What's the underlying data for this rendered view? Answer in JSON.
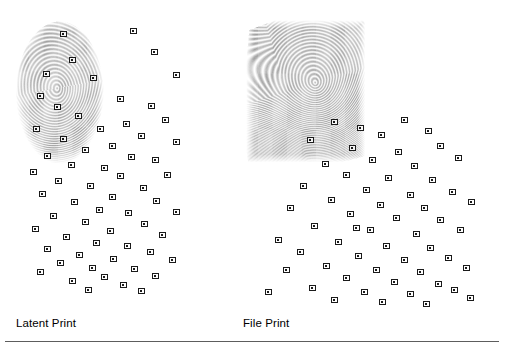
{
  "figure": {
    "title_visible": false,
    "background_color": "#ffffff",
    "ridge_color": "#9a9a9a",
    "marker_color": "#1a1a1a",
    "rule_color": "#5d5d5d"
  },
  "panels": [
    {
      "id": "latent",
      "caption": "Latent Print",
      "caption_x": 16,
      "caption_y": 316,
      "shape": "oval",
      "frame": {
        "x": 14,
        "y": 16,
        "width": 182,
        "height": 296
      },
      "core": {
        "x": 100,
        "y": 160
      },
      "ridge_spacing": 6.2,
      "ridge_color": "#9a9a9a",
      "minutiae_count": 63,
      "minutiae": [
        [
          63,
          34
        ],
        [
          133,
          31
        ],
        [
          154,
          52
        ],
        [
          72,
          60
        ],
        [
          46,
          74
        ],
        [
          176,
          75
        ],
        [
          93,
          78
        ],
        [
          40,
          96
        ],
        [
          120,
          99
        ],
        [
          57,
          107
        ],
        [
          151,
          106
        ],
        [
          78,
          116
        ],
        [
          126,
          124
        ],
        [
          165,
          120
        ],
        [
          36,
          129
        ],
        [
          100,
          129
        ],
        [
          141,
          136
        ],
        [
          63,
          139
        ],
        [
          112,
          146
        ],
        [
          176,
          142
        ],
        [
          85,
          150
        ],
        [
          47,
          156
        ],
        [
          131,
          157
        ],
        [
          155,
          160
        ],
        [
          71,
          165
        ],
        [
          104,
          168
        ],
        [
          33,
          172
        ],
        [
          120,
          176
        ],
        [
          167,
          175
        ],
        [
          58,
          181
        ],
        [
          90,
          186
        ],
        [
          143,
          188
        ],
        [
          42,
          194
        ],
        [
          112,
          197
        ],
        [
          74,
          202
        ],
        [
          156,
          201
        ],
        [
          99,
          210
        ],
        [
          128,
          213
        ],
        [
          53,
          216
        ],
        [
          176,
          212
        ],
        [
          85,
          222
        ],
        [
          144,
          224
        ],
        [
          35,
          229
        ],
        [
          110,
          231
        ],
        [
          66,
          237
        ],
        [
          162,
          235
        ],
        [
          96,
          243
        ],
        [
          127,
          246
        ],
        [
          47,
          249
        ],
        [
          79,
          255
        ],
        [
          150,
          252
        ],
        [
          113,
          259
        ],
        [
          60,
          263
        ],
        [
          172,
          260
        ],
        [
          92,
          268
        ],
        [
          134,
          269
        ],
        [
          40,
          272
        ],
        [
          104,
          277
        ],
        [
          155,
          276
        ],
        [
          72,
          281
        ],
        [
          123,
          285
        ],
        [
          88,
          290
        ],
        [
          141,
          291
        ]
      ]
    },
    {
      "id": "file",
      "caption": "File Print",
      "caption_x": 243,
      "caption_y": 316,
      "shape": "rolled-rect",
      "frame": {
        "x": 243,
        "y": 18,
        "width": 248,
        "height": 294
      },
      "core": {
        "x": 387,
        "y": 147
      },
      "ridge_spacing": 6.0,
      "ridge_color": "#9a9a9a",
      "minutiae_count": 58,
      "minutiae": [
        [
          334,
          122
        ],
        [
          360,
          128
        ],
        [
          404,
          120
        ],
        [
          381,
          135
        ],
        [
          428,
          131
        ],
        [
          310,
          140
        ],
        [
          352,
          148
        ],
        [
          398,
          152
        ],
        [
          440,
          146
        ],
        [
          372,
          160
        ],
        [
          325,
          164
        ],
        [
          414,
          166
        ],
        [
          458,
          158
        ],
        [
          346,
          175
        ],
        [
          388,
          178
        ],
        [
          432,
          180
        ],
        [
          303,
          186
        ],
        [
          366,
          190
        ],
        [
          410,
          195
        ],
        [
          452,
          192
        ],
        [
          331,
          200
        ],
        [
          380,
          205
        ],
        [
          424,
          208
        ],
        [
          471,
          202
        ],
        [
          350,
          214
        ],
        [
          396,
          218
        ],
        [
          440,
          220
        ],
        [
          314,
          226
        ],
        [
          370,
          230
        ],
        [
          416,
          234
        ],
        [
          460,
          230
        ],
        [
          338,
          242
        ],
        [
          386,
          246
        ],
        [
          430,
          248
        ],
        [
          300,
          252
        ],
        [
          358,
          256
        ],
        [
          404,
          260
        ],
        [
          448,
          258
        ],
        [
          326,
          266
        ],
        [
          376,
          270
        ],
        [
          420,
          272
        ],
        [
          466,
          268
        ],
        [
          346,
          278
        ],
        [
          394,
          282
        ],
        [
          438,
          284
        ],
        [
          312,
          288
        ],
        [
          364,
          292
        ],
        [
          410,
          294
        ],
        [
          454,
          290
        ],
        [
          334,
          300
        ],
        [
          382,
          302
        ],
        [
          426,
          304
        ],
        [
          470,
          298
        ],
        [
          356,
          228
        ],
        [
          290,
          208
        ],
        [
          278,
          240
        ],
        [
          286,
          270
        ],
        [
          268,
          292
        ]
      ]
    }
  ]
}
